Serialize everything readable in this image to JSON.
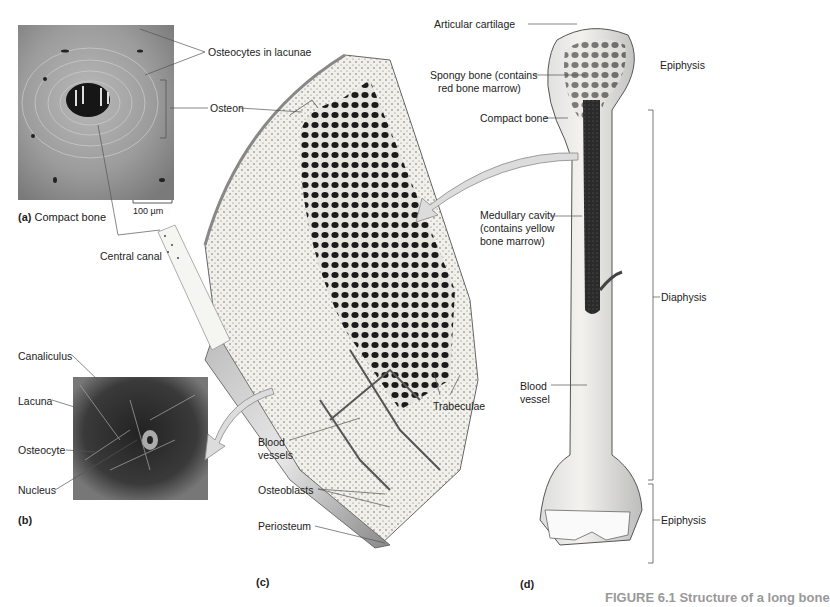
{
  "figure": {
    "caption_partial": "FIGURE 6.1 Structure of a long bone",
    "panels": {
      "a": {
        "letter": "(a)",
        "title": "Compact bone",
        "scale_bar": "100 µm"
      },
      "b": {
        "letter": "(b)"
      },
      "c": {
        "letter": "(c)"
      },
      "d": {
        "letter": "(d)"
      }
    },
    "labels": {
      "osteocytes_in_lacunae": "Osteocytes in lacunae",
      "osteon": "Osteon",
      "central_canal": "Central canal",
      "canaliculus": "Canaliculus",
      "lacuna": "Lacuna",
      "osteocyte": "Osteocyte",
      "nucleus": "Nucleus",
      "trabeculae": "Trabeculae",
      "blood_vessels": "Blood vessels",
      "blood_vessels_l1": "Blood",
      "blood_vessels_l2": "vessels",
      "osteoblasts": "Osteoblasts",
      "periosteum": "Periosteum",
      "articular_cartilage": "Articular cartilage",
      "spongy_bone_l1": "Spongy bone (contains",
      "spongy_bone_l2": "red bone marrow)",
      "compact_bone": "Compact bone",
      "medullary_l1": "Medullary cavity",
      "medullary_l2": "(contains yellow",
      "medullary_l3": "bone marrow)",
      "blood_vessel_l1": "Blood",
      "blood_vessel_l2": "vessel",
      "epiphysis_top": "Epiphysis",
      "diaphysis": "Diaphysis",
      "epiphysis_bottom": "Epiphysis"
    },
    "colors": {
      "photo_gray": "#8a8a8a",
      "photo_dark": "#1a1a1a",
      "bone_fill": "#efeee8",
      "marrow": "#2a2a2a",
      "arrow_fill": "#d9d9d9"
    }
  }
}
